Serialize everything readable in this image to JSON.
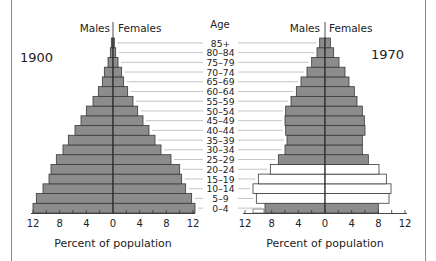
{
  "chart_data": [
    {
      "type": "bar",
      "subtype": "population-pyramid",
      "title": "1900",
      "xlabel": "Percent of population",
      "ylabel": "Age",
      "left_label": "Males",
      "right_label": "Females",
      "xlim": [
        12,
        12
      ],
      "x_ticks": [
        12,
        8,
        4,
        0,
        4,
        8,
        12
      ],
      "categories": [
        "0-4",
        "5-9",
        "10-14",
        "15-19",
        "20-24",
        "25-29",
        "30-34",
        "35-39",
        "40-44",
        "45-49",
        "50-54",
        "55-59",
        "60-64",
        "65-69",
        "70-74",
        "75-79",
        "80-84",
        "85+"
      ],
      "series": [
        {
          "name": "Males",
          "values": [
            12.0,
            11.5,
            10.5,
            9.6,
            9.3,
            8.5,
            7.5,
            6.7,
            5.7,
            4.8,
            4.0,
            3.0,
            2.2,
            1.6,
            1.3,
            0.75,
            0.4,
            0.25
          ]
        },
        {
          "name": "Females",
          "values": [
            12.3,
            11.8,
            10.9,
            10.3,
            10.0,
            8.7,
            7.2,
            6.3,
            5.4,
            4.5,
            3.7,
            3.0,
            2.2,
            1.6,
            1.3,
            0.75,
            0.4,
            0.2
          ]
        }
      ],
      "highlight_rows": []
    },
    {
      "type": "bar",
      "subtype": "population-pyramid",
      "title": "1970",
      "xlabel": "Percent of population",
      "ylabel": "Age",
      "left_label": "Males",
      "right_label": "Females",
      "xlim": [
        12,
        12
      ],
      "x_ticks": [
        12,
        8,
        4,
        0,
        4,
        8,
        12
      ],
      "categories": [
        "0-4",
        "5-9",
        "10-14",
        "15-19",
        "20-24",
        "25-29",
        "30-34",
        "35-39",
        "40-44",
        "45-49",
        "50-54",
        "55-59",
        "60-64",
        "65-69",
        "70-74",
        "75-79",
        "80-84",
        "85+"
      ],
      "series": [
        {
          "name": "Males",
          "values": [
            9.0,
            10.3,
            10.8,
            10.0,
            8.2,
            7.0,
            6.0,
            5.7,
            5.9,
            6.0,
            5.9,
            5.1,
            4.3,
            3.6,
            2.7,
            2.0,
            1.2,
            0.8
          ]
        },
        {
          "name": "Females",
          "values": [
            8.0,
            9.6,
            9.9,
            9.2,
            8.1,
            6.5,
            5.6,
            5.6,
            6.0,
            5.9,
            5.6,
            4.8,
            4.4,
            3.6,
            3.0,
            2.1,
            1.3,
            0.8
          ]
        }
      ],
      "highlight_rows": [
        "5-9",
        "10-14",
        "15-19",
        "20-24"
      ],
      "highlight_note": "White (unfilled) bars mark the baby-boom cohorts"
    }
  ],
  "labels": {
    "age_header": "Age",
    "males": "Males",
    "females": "Females",
    "year_left": "1900",
    "year_right": "1970",
    "xlabel": "Percent of population"
  },
  "colors": {
    "bar_fill": "#8c8c8c",
    "bar_stroke": "#3a3a3a",
    "highlight_fill": "#ffffff",
    "leader_line": "#b5b5b5",
    "axis": "#333333",
    "frame": "#8a8a8a"
  }
}
